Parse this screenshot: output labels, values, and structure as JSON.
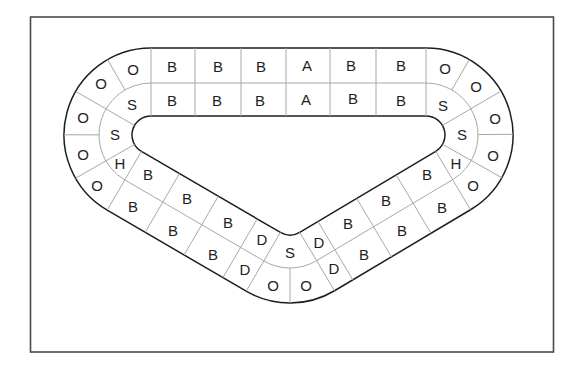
{
  "diagram": {
    "type": "board-game-track",
    "shape": "rounded-triangle-loop with two lanes",
    "colors": {
      "background": "#ffffff",
      "frame": "#4a4a4a",
      "track_edge": "#1e1e1e",
      "cell_divider": "#a8a8a8",
      "label": "#1e1e1e"
    }
  },
  "track": {
    "top_straight": {
      "outer": [
        "B",
        "B",
        "B",
        "A",
        "B",
        "B"
      ],
      "inner": [
        "B",
        "B",
        "B",
        "A",
        "B",
        "B"
      ]
    },
    "left_curve": {
      "outer": [
        "O",
        "O",
        "O",
        "O",
        "O"
      ],
      "inner": [
        "S",
        "S",
        "H"
      ]
    },
    "left_diagonal": {
      "inner": [
        "B",
        "B",
        "B",
        "D"
      ],
      "outer": [
        "B",
        "B",
        "B",
        "D"
      ]
    },
    "bottom_curve": {
      "inner": [
        "S"
      ],
      "outer": [
        "O",
        "O"
      ]
    },
    "right_diagonal": {
      "inner": [
        "D",
        "B",
        "B",
        "B"
      ],
      "outer": [
        "D",
        "B",
        "B",
        "B"
      ]
    },
    "right_curve": {
      "outer": [
        "O",
        "O",
        "O",
        "O",
        "O"
      ],
      "inner": [
        "S",
        "S",
        "H"
      ]
    }
  }
}
